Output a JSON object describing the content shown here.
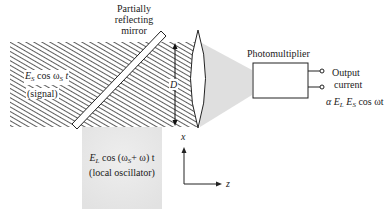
{
  "mirror": {
    "label_line1": "Partially",
    "label_line2": "reflecting",
    "label_line3": "mirror"
  },
  "signal": {
    "E": "E",
    "E_sub": "S",
    "cos": " cos ",
    "omega": "ω",
    "omega_sub": "S",
    "t": " t",
    "label": "(signal)"
  },
  "local_oscillator": {
    "E": "E",
    "E_sub": "L",
    "expr1": " cos (",
    "omega": "ω",
    "omega_sub": "S",
    "expr2": "+ ω) t",
    "label": "(local oscillator)"
  },
  "aperture": {
    "label": "D"
  },
  "detector": {
    "label": "Photomultiplier",
    "output_line1": "Output",
    "output_line2": "current",
    "proportional": "α ",
    "E1": "E",
    "E1_sub": "L",
    "E2": " E",
    "E2_sub": "S",
    "tail": " cos ωt"
  },
  "axes": {
    "x_label": "x",
    "z_label": "z"
  },
  "colors": {
    "hatch": "#333333",
    "beam_fill": "#ffffff",
    "lo_fill": "#e8e8e8",
    "focus_cone": "#dcdcdc",
    "line": "#222222"
  }
}
